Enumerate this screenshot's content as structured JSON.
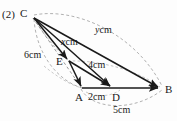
{
  "figure": {
    "problem_number": "(2)",
    "vertices": [
      {
        "id": "C",
        "label": "C",
        "x": 32,
        "y": 16
      },
      {
        "id": "E",
        "label": "E",
        "x": 68,
        "y": 60
      },
      {
        "id": "A",
        "label": "A",
        "x": 82,
        "y": 88
      },
      {
        "id": "D",
        "label": "D",
        "x": 112,
        "y": 88
      },
      {
        "id": "B",
        "label": "B",
        "x": 160,
        "y": 88
      }
    ],
    "measures": {
      "ca": "6cm",
      "ce": "x cm",
      "cb": "y cm",
      "ed": "4cm",
      "ad": "2cm",
      "ab": "5cm"
    },
    "measure_parts": {
      "ce_var": "x",
      "ce_unit": "cm",
      "cb_var": "y",
      "cb_unit": "cm"
    },
    "colors": {
      "solid_stroke": "#1a1a1a",
      "dashed_stroke": "#9a9a9a",
      "background": "#fdfdfd",
      "text": "#1a1a1a"
    }
  }
}
